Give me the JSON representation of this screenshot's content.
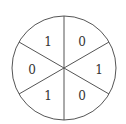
{
  "diagram": {
    "type": "spinner",
    "center": [
      64,
      68
    ],
    "radius": 52,
    "stroke_color": "#555555",
    "text_color": "#333333",
    "divider_angles_deg": [
      90,
      30,
      150
    ],
    "sectors": [
      {
        "position": "top-left",
        "label": "1",
        "x": 48,
        "y": 42
      },
      {
        "position": "top-right",
        "label": "0",
        "x": 82,
        "y": 42
      },
      {
        "position": "right",
        "label": "1",
        "x": 99,
        "y": 70
      },
      {
        "position": "bottom-right",
        "label": "0",
        "x": 82,
        "y": 96
      },
      {
        "position": "bottom-left",
        "label": "1",
        "x": 48,
        "y": 96
      },
      {
        "position": "left",
        "label": "0",
        "x": 32,
        "y": 70
      }
    ]
  }
}
